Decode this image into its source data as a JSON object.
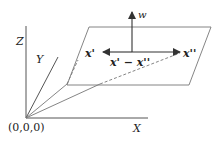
{
  "diagram": {
    "axes": {
      "z_label": "Z",
      "y_label": "Y",
      "x_label": "X",
      "origin_label": "(0,0,0)"
    },
    "plane": {
      "normal_label": "w",
      "point1_label": "x'",
      "point2_label": "x''",
      "difference_label": "x' − x''"
    },
    "colors": {
      "line": "#555555",
      "text": "#222222"
    }
  }
}
